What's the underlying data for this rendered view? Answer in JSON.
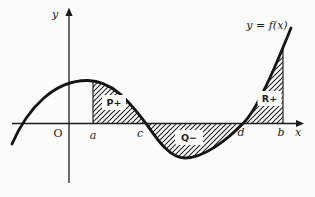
{
  "figure": {
    "curve_label": "y = f(x)",
    "axis": {
      "y": "y",
      "x": "x",
      "origin": "O"
    },
    "x_marks": {
      "a": "a",
      "c": "c",
      "d": "d",
      "b": "b"
    },
    "regions": {
      "p": "P+",
      "q": "Q−",
      "r": "R+"
    },
    "colors": {
      "ink": "#1b1b1b",
      "paper": "#fbfbf9"
    }
  }
}
